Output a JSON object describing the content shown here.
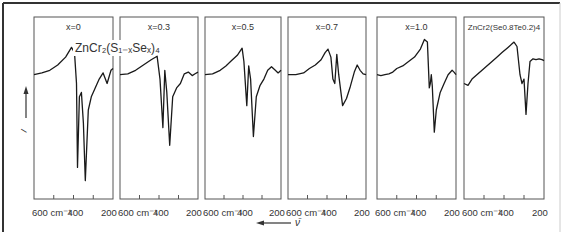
{
  "figure": {
    "y_axis_label": "I",
    "x_axis_arrow_label": "ν̄",
    "tick_labels": [
      "600 cm⁻¹",
      "400",
      "200"
    ],
    "series_title": "ZnCr₂(S₁₋ₓSeₓ)₄"
  },
  "chart_data": [
    {
      "type": "line",
      "panel": 1,
      "title": "x = 0",
      "annotation": "ZnCr2(S1-x Se x)4",
      "xlabel": "cm-1",
      "ylabel": "I",
      "xlim": [
        600,
        200
      ],
      "x": [
        600,
        560,
        520,
        480,
        440,
        410,
        395,
        385,
        380,
        370,
        360,
        350,
        340,
        325,
        310,
        290,
        270,
        250,
        230,
        210,
        200
      ],
      "values": [
        0.55,
        0.57,
        0.6,
        0.66,
        0.75,
        0.86,
        0.8,
        0.45,
        -0.5,
        0.3,
        0.35,
        0.0,
        -0.65,
        0.15,
        0.3,
        0.4,
        0.5,
        0.57,
        0.45,
        0.6,
        0.62
      ]
    },
    {
      "type": "line",
      "panel": 2,
      "title": "x = 0.3",
      "xlabel": "cm-1",
      "ylabel": "I",
      "xlim": [
        600,
        200
      ],
      "x": [
        600,
        560,
        520,
        480,
        440,
        410,
        395,
        380,
        370,
        360,
        345,
        330,
        310,
        290,
        270,
        250,
        230,
        215,
        200
      ],
      "values": [
        0.55,
        0.56,
        0.6,
        0.66,
        0.72,
        0.76,
        0.5,
        -0.05,
        0.6,
        0.35,
        -0.25,
        0.3,
        0.4,
        0.45,
        0.56,
        0.58,
        0.54,
        0.56,
        0.58
      ]
    },
    {
      "type": "line",
      "panel": 3,
      "title": "x = 0.5",
      "xlabel": "cm-1",
      "ylabel": "I",
      "xlim": [
        600,
        200
      ],
      "x": [
        600,
        560,
        520,
        490,
        460,
        430,
        405,
        395,
        380,
        370,
        360,
        345,
        330,
        310,
        290,
        270,
        250,
        230,
        215,
        200
      ],
      "values": [
        0.55,
        0.56,
        0.6,
        0.65,
        0.71,
        0.77,
        0.85,
        0.7,
        0.2,
        0.65,
        0.5,
        -0.15,
        0.3,
        0.43,
        0.5,
        0.6,
        0.64,
        0.6,
        0.57,
        0.6
      ]
    },
    {
      "type": "line",
      "panel": 4,
      "title": "x = 0.7",
      "xlabel": "cm-1",
      "ylabel": "I",
      "xlim": [
        600,
        200
      ],
      "x": [
        600,
        560,
        520,
        490,
        460,
        430,
        410,
        395,
        380,
        370,
        360,
        350,
        340,
        320,
        300,
        280,
        260,
        245,
        230,
        215,
        200
      ],
      "values": [
        0.55,
        0.55,
        0.57,
        0.62,
        0.66,
        0.72,
        0.8,
        0.84,
        0.75,
        0.5,
        0.45,
        0.78,
        0.55,
        0.2,
        0.28,
        0.42,
        0.58,
        0.66,
        0.6,
        0.56,
        0.55
      ]
    },
    {
      "type": "line",
      "panel": 5,
      "title": "x = 1.0",
      "xlabel": "cm-1",
      "ylabel": "I",
      "xlim": [
        600,
        200
      ],
      "x": [
        600,
        580,
        560,
        540,
        520,
        500,
        470,
        440,
        410,
        380,
        360,
        345,
        335,
        330,
        325,
        320,
        310,
        300,
        280,
        260,
        240,
        220,
        210,
        200
      ],
      "values": [
        0.55,
        0.54,
        0.55,
        0.56,
        0.58,
        0.62,
        0.65,
        0.7,
        0.75,
        0.84,
        0.95,
        0.92,
        0.4,
        0.45,
        0.55,
        0.42,
        -0.1,
        0.15,
        0.35,
        0.45,
        0.55,
        0.6,
        0.58,
        0.55
      ]
    },
    {
      "type": "line",
      "panel": 6,
      "title": "ZnCr2(Se0.8Te0.2)4",
      "xlabel": "cm-1",
      "ylabel": "I",
      "xlim": [
        600,
        200
      ],
      "x": [
        600,
        580,
        560,
        530,
        500,
        470,
        440,
        410,
        380,
        350,
        335,
        320,
        310,
        300,
        290,
        280,
        270,
        255,
        240,
        225,
        210,
        200
      ],
      "values": [
        0.45,
        0.43,
        0.5,
        0.56,
        0.62,
        0.68,
        0.74,
        0.8,
        0.86,
        0.92,
        0.87,
        0.55,
        0.45,
        0.5,
        0.1,
        0.45,
        0.7,
        0.73,
        0.72,
        0.73,
        0.72,
        0.71
      ]
    }
  ]
}
